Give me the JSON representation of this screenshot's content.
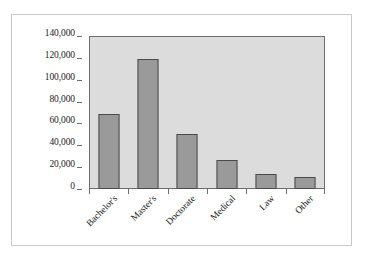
{
  "chart_data": {
    "type": "bar",
    "title": "",
    "subtitle": "",
    "xlabel": "",
    "ylabel": "",
    "categories": [
      "Bachelor's",
      "Master's",
      "Doctorate",
      "Medical",
      "Law",
      "Other"
    ],
    "values": [
      69000,
      119000,
      50000,
      27000,
      14000,
      11000
    ],
    "ylim": [
      0,
      140000
    ],
    "ytick_values": [
      0,
      20000,
      40000,
      60000,
      80000,
      100000,
      120000,
      140000
    ],
    "ytick_labels": [
      "0",
      "20,000",
      "40,000",
      "60,000",
      "80,000",
      "100,000",
      "120,000",
      "140,000"
    ],
    "grid": false,
    "legend": false,
    "legend_position": "none",
    "xtick_rotation": -45,
    "colors": {
      "bar_fill": "#9a9a9a",
      "bar_border": "#4a4a4a",
      "plot_background": "#dcdcdc",
      "axis": "#6e6e6e",
      "page_background": "#ffffff",
      "frame_border": "#c9c9c9",
      "text": "#1a1a1a"
    }
  }
}
